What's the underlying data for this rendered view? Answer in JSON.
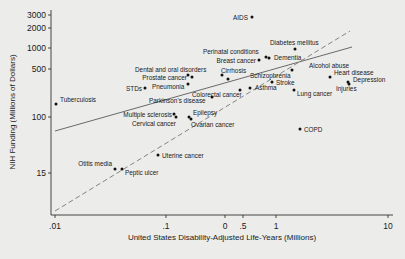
{
  "chart_data": {
    "type": "scatter",
    "title": "",
    "xlabel": "United States Disability-Adjusted Life-Years (Millions)",
    "ylabel": "NIH Funding (Millions of Dollars)",
    "x_scale": "log",
    "y_scale": "log",
    "xlim": [
      0.0095,
      11
    ],
    "ylim": [
      6,
      3300
    ],
    "x_ticks": [
      {
        "value": 0.01,
        "label": ".01",
        "px": 55
      },
      {
        "value": 0.1,
        "label": ".1",
        "px": 166
      },
      {
        "value": 0.3,
        "label": "0",
        "px": 225
      },
      {
        "value": 0.45,
        "label": ".5",
        "px": 243
      },
      {
        "value": 1,
        "label": "1",
        "px": 276
      },
      {
        "value": 10,
        "label": "10",
        "px": 388
      }
    ],
    "y_ticks": [
      {
        "value": 3000,
        "label": "3000",
        "px": 15
      },
      {
        "value": 2000,
        "label": "2000",
        "px": 28
      },
      {
        "value": 1000,
        "label": "1000",
        "px": 48
      },
      {
        "value": 500,
        "label": "500",
        "px": 69
      },
      {
        "value": 100,
        "label": "100",
        "px": 117
      },
      {
        "value": 15,
        "label": "15",
        "px": 173
      }
    ],
    "grid": false,
    "legend": null,
    "points": [
      {
        "label": "AIDS",
        "x": 0.61,
        "y": 2800,
        "px": 252,
        "py": 17,
        "lx": 248,
        "ly": 20,
        "anchor": "end"
      },
      {
        "label": "Diabetes mellitus",
        "x": 1.55,
        "y": 1050,
        "px": 295,
        "py": 49,
        "lx": 270,
        "ly": 45,
        "anchor": "start"
      },
      {
        "label": "Perinatal conditions",
        "x": 0.72,
        "y": 760,
        "px": 266,
        "py": 57,
        "lx": 203,
        "ly": 54,
        "anchor": "start"
      },
      {
        "label": "Dementia",
        "x": 0.83,
        "y": 720,
        "px": 269,
        "py": 58,
        "lx": 274,
        "ly": 60,
        "anchor": "start"
      },
      {
        "label": "Breast cancer",
        "x": 0.66,
        "y": 680,
        "px": 259,
        "py": 60,
        "lx": 256,
        "ly": 63,
        "anchor": "end"
      },
      {
        "label": "Alcohol abuse",
        "x": 1.43,
        "y": 450,
        "px": 292,
        "py": 70,
        "lx": 309,
        "ly": 68,
        "anchor": "start"
      },
      {
        "label": "Dental and oral disorders",
        "x": 0.16,
        "y": 400,
        "px": 188,
        "py": 75,
        "lx": 135,
        "ly": 72,
        "anchor": "start"
      },
      {
        "label": "Cirrhosis",
        "x": 0.33,
        "y": 390,
        "px": 222,
        "py": 75,
        "lx": 221,
        "ly": 73,
        "anchor": "start"
      },
      {
        "label": "Prostate cancer",
        "x": 0.18,
        "y": 360,
        "px": 192,
        "py": 77,
        "lx": 187,
        "ly": 80,
        "anchor": "end"
      },
      {
        "label": "Schizophrenia",
        "x": 0.37,
        "y": 340,
        "px": 228,
        "py": 79,
        "lx": 250,
        "ly": 78,
        "anchor": "start"
      },
      {
        "label": "Heart disease",
        "x": 3.7,
        "y": 330,
        "px": 330,
        "py": 77,
        "lx": 334,
        "ly": 75,
        "anchor": "start"
      },
      {
        "label": "Depression",
        "x": 5.4,
        "y": 300,
        "px": 348,
        "py": 82,
        "lx": 353,
        "ly": 82,
        "anchor": "start"
      },
      {
        "label": "Injuries",
        "x": 5.5,
        "y": 285,
        "px": 349,
        "py": 84,
        "lx": 336,
        "ly": 91,
        "anchor": "start"
      },
      {
        "label": "Stroke",
        "x": 0.92,
        "y": 310,
        "px": 272,
        "py": 82,
        "lx": 276,
        "ly": 85,
        "anchor": "start"
      },
      {
        "label": "Pneumonia",
        "x": 0.15,
        "y": 280,
        "px": 188,
        "py": 84,
        "lx": 152,
        "ly": 89,
        "anchor": "start"
      },
      {
        "label": "Asthma",
        "x": 0.57,
        "y": 270,
        "px": 250,
        "py": 88,
        "lx": 255,
        "ly": 90,
        "anchor": "start"
      },
      {
        "label": "Colorectal cancer",
        "x": 0.45,
        "y": 250,
        "px": 240,
        "py": 90,
        "lx": 192,
        "ly": 97,
        "anchor": "start"
      },
      {
        "label": "Lung cancer",
        "x": 0.95,
        "y": 240,
        "px": 294,
        "py": 90,
        "lx": 297,
        "ly": 96,
        "anchor": "start"
      },
      {
        "label": "STDs",
        "x": 0.078,
        "y": 230,
        "px": 145,
        "py": 88,
        "lx": 142,
        "ly": 91,
        "anchor": "end"
      },
      {
        "label": "Parkinson's disease",
        "x": 0.21,
        "y": 210,
        "px": 212,
        "py": 97,
        "lx": 149,
        "ly": 103,
        "anchor": "start"
      },
      {
        "label": "Tuberculosis",
        "x": 0.0104,
        "y": 160,
        "px": 56,
        "py": 104,
        "lx": 60,
        "ly": 102,
        "anchor": "start"
      },
      {
        "label": "Multiple sclerosis",
        "x": 0.095,
        "y": 105,
        "px": 174,
        "py": 114,
        "lx": 172,
        "ly": 117,
        "anchor": "end"
      },
      {
        "label": "Cervical cancer",
        "x": 0.1,
        "y": 98,
        "px": 176,
        "py": 117,
        "lx": 176,
        "ly": 126,
        "anchor": "end"
      },
      {
        "label": "Epilepsy",
        "x": 0.12,
        "y": 100,
        "px": 189,
        "py": 117,
        "lx": 193,
        "ly": 115,
        "anchor": "start"
      },
      {
        "label": "Ovarian cancer",
        "x": 0.13,
        "y": 90,
        "px": 191,
        "py": 119,
        "lx": 191,
        "ly": 127,
        "anchor": "start"
      },
      {
        "label": "COPD",
        "x": 1.45,
        "y": 75,
        "px": 300,
        "py": 129,
        "lx": 304,
        "ly": 132,
        "anchor": "start"
      },
      {
        "label": "Uterine cancer",
        "x": 0.088,
        "y": 22,
        "px": 158,
        "py": 155,
        "lx": 162,
        "ly": 158,
        "anchor": "start"
      },
      {
        "label": "Otitis media",
        "x": 0.043,
        "y": 14.5,
        "px": 115,
        "py": 169,
        "lx": 112,
        "ly": 166,
        "anchor": "end"
      },
      {
        "label": "Peptic ulcer",
        "x": 0.045,
        "y": 14.7,
        "px": 122,
        "py": 169,
        "lx": 125,
        "ly": 175,
        "anchor": "start"
      }
    ],
    "fit_lines": [
      {
        "name": "regression-fit",
        "style": "solid",
        "x1": 55,
        "y1": 131,
        "x2": 352,
        "y2": 47
      },
      {
        "name": "reference-line",
        "style": "dashed",
        "x1": 55,
        "y1": 211,
        "x2": 350,
        "y2": 31
      }
    ],
    "colors": {
      "background": "#ececea",
      "axis": "#333333",
      "points": "#111111",
      "solid_line": "#5a5a5a",
      "dashed_line": "#777777"
    }
  }
}
